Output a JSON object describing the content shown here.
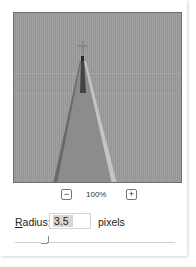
{
  "preview": {
    "zoom_out_icon": "minus-icon",
    "zoom_in_icon": "plus-icon",
    "zoom_out_glyph": "−",
    "zoom_in_glyph": "+",
    "zoom_level": "100%"
  },
  "radius": {
    "label_mnemonic": "R",
    "label_rest": "adius:",
    "value": "3.5",
    "unit": "pixels"
  },
  "colors": {
    "preview_bg": "#9b9b9b",
    "border": "#6e6e6e",
    "selection": "#d6d6d6"
  }
}
